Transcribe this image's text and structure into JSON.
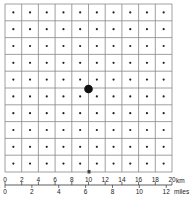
{
  "diagram": {
    "grid": {
      "columns": 10,
      "rows": 10,
      "line_color": "#888888"
    },
    "central_point": {
      "label": "central-dot",
      "color": "#111111"
    },
    "scale_km": {
      "ticks": [
        "0",
        "2",
        "4",
        "6",
        "8",
        "10",
        "12",
        "14",
        "16",
        "18",
        "20"
      ],
      "unit": "km"
    },
    "scale_miles": {
      "ticks": [
        "0",
        "2",
        "4",
        "6",
        "8",
        "10",
        "12"
      ],
      "unit": "miles"
    }
  }
}
